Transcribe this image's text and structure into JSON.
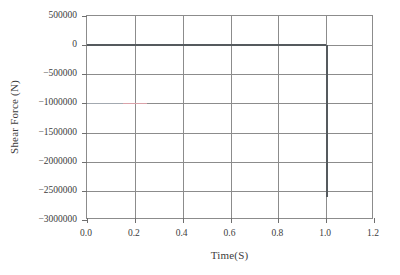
{
  "chart_data": {
    "type": "line",
    "title": "",
    "xlabel": "Time(S)",
    "ylabel": "Shear Force (N)",
    "xlim": [
      0.0,
      1.2
    ],
    "ylim": [
      -3000000,
      500000
    ],
    "grid": true,
    "legend": "none",
    "xticks": [
      "0.0",
      "0.2",
      "0.4",
      "0.6",
      "0.8",
      "1.0",
      "1.2"
    ],
    "xtick_values": [
      0.0,
      0.2,
      0.4,
      0.6,
      0.8,
      1.0,
      1.2
    ],
    "yticks": [
      "500000",
      "0",
      "−500000",
      "−1000000",
      "−1500000",
      "−2000000",
      "−2500000",
      "−3000000"
    ],
    "ytick_values": [
      500000,
      0,
      -500000,
      -1000000,
      -1500000,
      -2000000,
      -2500000,
      -3000000
    ],
    "series": [
      {
        "name": "shear-force",
        "color": "#555a5e",
        "x": [
          0.0,
          0.1,
          0.2,
          0.3,
          0.4,
          0.5,
          0.6,
          0.7,
          0.8,
          0.9,
          0.98,
          1.0,
          1.0,
          1.01
        ],
        "values": [
          0,
          0,
          0,
          0,
          0,
          0,
          0,
          0,
          0,
          0,
          0,
          0,
          -2600000,
          0
        ]
      },
      {
        "name": "secondary-trace",
        "color": "#e8a6ae",
        "x": [
          0.15,
          0.2,
          0.25
        ],
        "values": [
          -1000000,
          -1000000,
          -1000000
        ]
      }
    ]
  },
  "axes": {
    "y_title": "Shear Force (N)",
    "x_title": "Time(S)"
  }
}
